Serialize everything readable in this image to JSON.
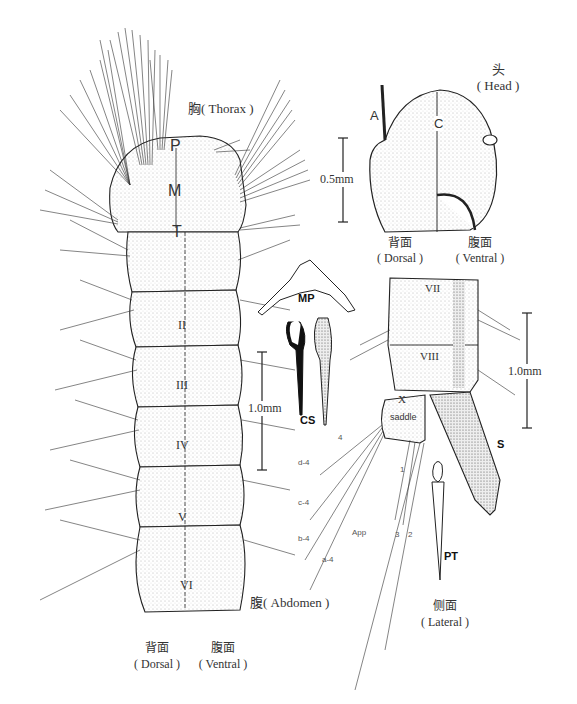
{
  "figure": {
    "views": {
      "thorax": {
        "label_cn": "胸",
        "label_en": "( Thorax )",
        "segments": [
          "P",
          "M",
          "T"
        ]
      },
      "head": {
        "label_cn": "头",
        "label_en": "( Head )",
        "markers": [
          "A",
          "C"
        ],
        "scale": "0.5mm",
        "dorsal_cn": "背面",
        "dorsal_en": "( Dorsal )",
        "ventral_cn": "腹面",
        "ventral_en": "( Ventral )",
        "setae": [
          "1",
          "4",
          "0",
          "6",
          "5",
          "7",
          "10",
          "9",
          "8",
          "11",
          "14",
          "13",
          "15",
          "12"
        ]
      },
      "abdomen": {
        "label_cn": "腹",
        "label_en": "( Abdomen )",
        "segments": [
          "I",
          "II",
          "III",
          "IV",
          "V",
          "VI"
        ],
        "scale": "1.0mm",
        "dorsal_cn": "背面",
        "dorsal_en": "( Dorsal )",
        "ventral_cn": "腹面",
        "ventral_en": "( Ventral )"
      },
      "terminal": {
        "label_cn": "侧面",
        "label_en": "( Lateral )",
        "segments": [
          "VII",
          "VIII",
          "X"
        ],
        "saddle": "saddle",
        "siphon": "S",
        "pecten_tooth": "PT",
        "scale": "1.0mm",
        "setae_labels": [
          "d-4",
          "c-4",
          "b-4",
          "a-4",
          "4",
          "App",
          "3",
          "2",
          "1"
        ],
        "siphon_setae": [
          "1",
          "2",
          "6",
          "7",
          "8",
          "9"
        ]
      },
      "mentum": {
        "label": "MP"
      },
      "comb_scale": {
        "label": "CS"
      }
    }
  }
}
